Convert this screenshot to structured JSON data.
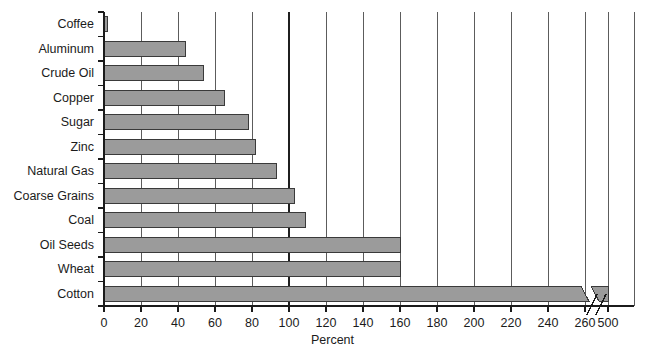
{
  "chart_data": {
    "type": "bar",
    "orientation": "horizontal",
    "title": "",
    "xlabel": "Percent",
    "ylabel": "",
    "categories": [
      "Coffee",
      "Aluminum",
      "Crude Oil",
      "Copper",
      "Sugar",
      "Zinc",
      "Natural Gas",
      "Coarse Grains",
      "Coal",
      "Oil Seeds",
      "Wheat",
      "Cotton"
    ],
    "values": [
      2,
      44,
      54,
      65,
      78,
      82,
      93,
      103,
      109,
      160,
      160,
      500
    ],
    "xlim": [
      0,
      500
    ],
    "xticks": [
      0,
      20,
      40,
      60,
      80,
      100,
      120,
      140,
      160,
      180,
      200,
      220,
      240,
      260,
      500
    ],
    "xtick_labels": [
      "0",
      "20",
      "40",
      "60",
      "80",
      "100",
      "120",
      "140",
      "160",
      "180",
      "200",
      "220",
      "240",
      "260",
      "500"
    ],
    "axis_break": {
      "present": true,
      "after_value": 260,
      "resume_value": 500
    },
    "grid": {
      "vertical": true,
      "horizontal": false,
      "emphasized_gridline": 100
    },
    "legend": {
      "present": false
    },
    "colors": {
      "bar_fill": "#9b9b9b",
      "bar_stroke": "#3a3a3a",
      "gridline": "#4a4a4a",
      "emphasis_gridline": "#1f1f1f",
      "axis": "#1b1b1b",
      "text": "#1b1b1b",
      "background": "#ffffff"
    }
  },
  "axis": {
    "x_title": "Percent"
  }
}
